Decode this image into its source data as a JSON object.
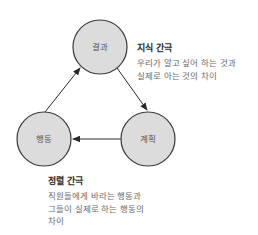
{
  "diagram": {
    "nodes": [
      {
        "id": "result",
        "label": "결과"
      },
      {
        "id": "plan",
        "label": "계획"
      },
      {
        "id": "action",
        "label": "행동"
      }
    ],
    "edges": [
      {
        "from": "result",
        "to": "plan"
      },
      {
        "from": "plan",
        "to": "action"
      },
      {
        "from": "action",
        "to": "result"
      }
    ],
    "colors": {
      "node_fill": "#dcdcdc",
      "node_stroke": "#3a3a3a",
      "arrow": "#2a2a2a"
    }
  },
  "notes": {
    "knowledge_gap": {
      "title": "지식 간극",
      "lines": [
        "우리가 알고 싶어 하는 것과",
        "실제로 아는 것의 차이"
      ]
    },
    "alignment_gap": {
      "title": "정렬 간극",
      "lines": [
        "직원들에게 바라는 행동과",
        "그들이 실제로 하는 행동의",
        "차이"
      ]
    }
  }
}
